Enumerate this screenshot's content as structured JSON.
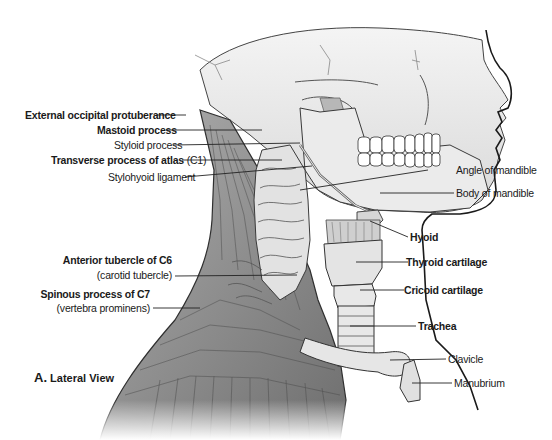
{
  "figure": {
    "caption_letter": "A.",
    "caption_text": "Lateral View"
  },
  "labels_left": [
    {
      "id": "external-occipital-protuberance",
      "text": "External occipital protuberance",
      "bold": true
    },
    {
      "id": "mastoid-process",
      "text": "Mastoid process",
      "bold": true
    },
    {
      "id": "styloid-process",
      "text": "Styloid process",
      "bold": false
    },
    {
      "id": "transverse-process-of-atlas",
      "text": "Transverse process of atlas",
      "suffix": " (C1)",
      "bold": true
    },
    {
      "id": "stylohyoid-ligament",
      "text": "Stylohyoid ligament",
      "bold": false
    },
    {
      "id": "anterior-tubercle-c6",
      "text": "Anterior tubercle of C6",
      "sub": "(carotid tubercle)",
      "bold": true
    },
    {
      "id": "spinous-process-c7",
      "text": "Spinous process of C7",
      "sub": "(vertebra prominens)",
      "bold": true
    }
  ],
  "labels_right": [
    {
      "id": "angle-of-mandible",
      "text": "Angle of mandible",
      "bold": false
    },
    {
      "id": "body-of-mandible",
      "text": "Body of mandible",
      "bold": false
    },
    {
      "id": "hyoid",
      "text": "Hyoid",
      "bold": true
    },
    {
      "id": "thyroid-cartilage",
      "text": "Thyroid cartilage",
      "bold": true
    },
    {
      "id": "cricoid-cartilage",
      "text": "Cricoid cartilage",
      "bold": true
    },
    {
      "id": "trachea",
      "text": "Trachea",
      "bold": true
    },
    {
      "id": "clavicle",
      "text": "Clavicle",
      "bold": false
    },
    {
      "id": "manubrium",
      "text": "Manubrium",
      "bold": false
    }
  ],
  "colors": {
    "bone": "#e6e6e6",
    "bone_shadow": "#bdbdbd",
    "muscle": "#8f8f8f",
    "muscle_dark": "#5c5c5c",
    "outline": "#2a2a2a",
    "leader": "#222222"
  }
}
